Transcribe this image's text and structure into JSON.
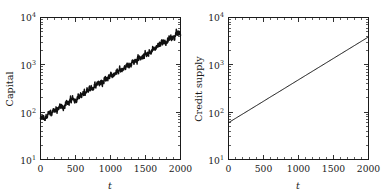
{
  "figure": {
    "background": "#ffffff",
    "ink_color": "#1a1a1a",
    "panel_count": 2
  },
  "chart_data": [
    {
      "panel": "left",
      "type": "line",
      "title": "",
      "xlabel": "t",
      "ylabel": "Capital",
      "xscale": "linear",
      "yscale": "log",
      "xlim": [
        0,
        2000
      ],
      "ylim": [
        10,
        10000
      ],
      "xticks": [
        0,
        500,
        1000,
        1500,
        2000
      ],
      "xticklabels": [
        "0",
        "500",
        "1000",
        "1500",
        "2000"
      ],
      "yticks": [
        10,
        100,
        1000,
        10000
      ],
      "yticklabels": [
        "10^1",
        "10^2",
        "10^3",
        "10^4"
      ],
      "ytick_mantissas": [
        "10",
        "10",
        "10",
        "10"
      ],
      "ytick_exponents": [
        "1",
        "2",
        "3",
        "4"
      ],
      "grid": false,
      "legend": null,
      "minor_ticks": true,
      "series": [
        {
          "name": "Capital",
          "style": "noisy exponential growth",
          "color": "#101010",
          "linewidth": 1.45,
          "noise_amplitude_dex": 0.045,
          "x": [
            0,
            100,
            200,
            300,
            400,
            500,
            600,
            700,
            800,
            900,
            1000,
            1100,
            1200,
            1300,
            1400,
            1500,
            1600,
            1700,
            1800,
            1900,
            2000
          ],
          "values": [
            70,
            86,
            107,
            132,
            163,
            201,
            249,
            307,
            380,
            469,
            580,
            716,
            885,
            1094,
            1351,
            1670,
            2063,
            2549,
            3150,
            3892,
            4810
          ]
        }
      ]
    },
    {
      "panel": "right",
      "type": "line",
      "title": "",
      "xlabel": "t",
      "ylabel": "Credit supply",
      "xscale": "linear",
      "yscale": "log",
      "xlim": [
        0,
        2000
      ],
      "ylim": [
        10,
        10000
      ],
      "xticks": [
        0,
        500,
        1000,
        1500,
        2000
      ],
      "xticklabels": [
        "0",
        "500",
        "1000",
        "1500",
        "2000"
      ],
      "yticks": [
        10,
        100,
        1000,
        10000
      ],
      "yticklabels": [
        "10^1",
        "10^2",
        "10^3",
        "10^4"
      ],
      "ytick_mantissas": [
        "10",
        "10",
        "10",
        "10"
      ],
      "ytick_exponents": [
        "1",
        "2",
        "3",
        "4"
      ],
      "grid": false,
      "legend": null,
      "minor_ticks": true,
      "series": [
        {
          "name": "Credit supply",
          "style": "smooth exponential growth",
          "color": "#101010",
          "linewidth": 1.0,
          "noise_amplitude_dex": 0,
          "x": [
            0,
            100,
            200,
            300,
            400,
            500,
            600,
            700,
            800,
            900,
            1000,
            1100,
            1200,
            1300,
            1400,
            1500,
            1600,
            1700,
            1800,
            1900,
            2000
          ],
          "values": [
            60,
            74,
            91,
            112,
            138,
            170,
            210,
            258,
            318,
            392,
            483,
            595,
            733,
            903,
            1112,
            1370,
            1688,
            2079,
            2561,
            3155,
            3886
          ]
        }
      ]
    }
  ]
}
